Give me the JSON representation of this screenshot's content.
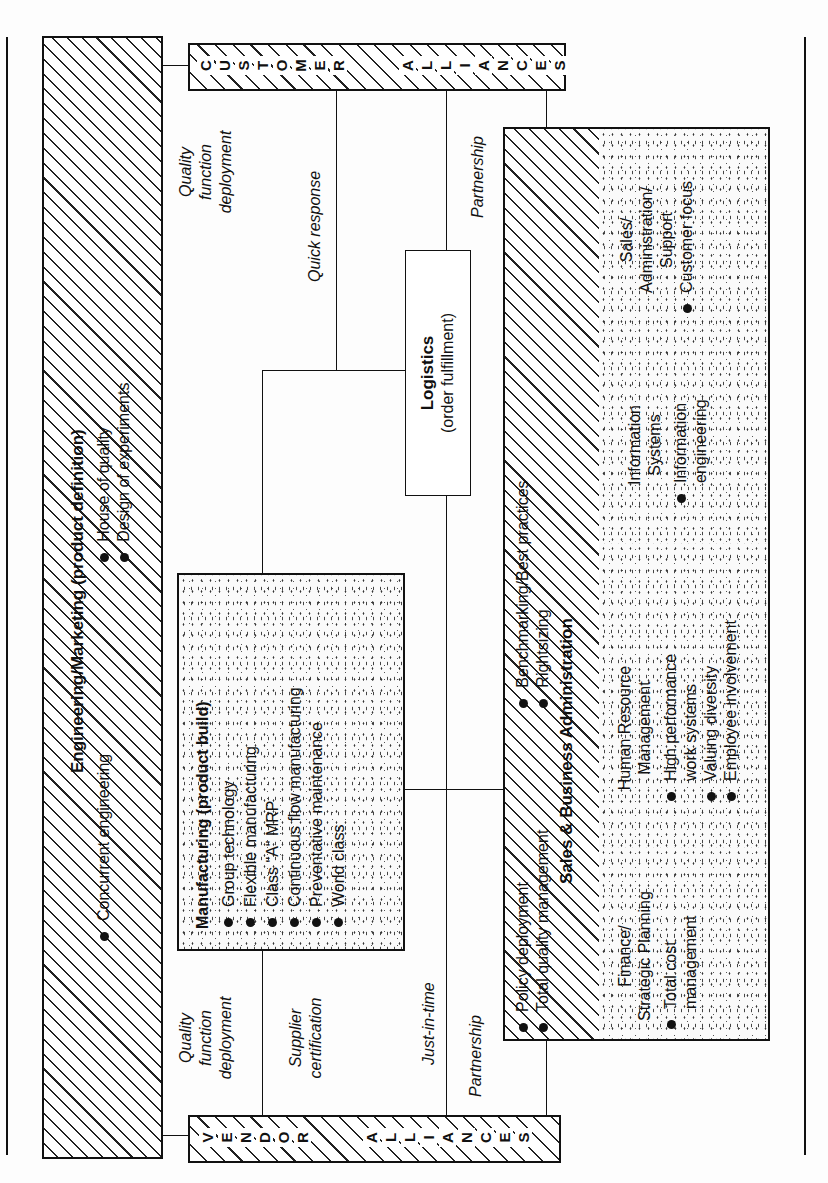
{
  "diagram": {
    "orientation": "rotated-90-counterclockwise",
    "engineering_marketing": {
      "title": "Engineering/Marketing  (product definition)",
      "items": [
        "Concurrent engineering",
        "House  of quality",
        "Design of experiments"
      ]
    },
    "customer_alliances": {
      "label": "CUSTOMER ALLIANCES",
      "letters": [
        "C",
        "U",
        "S",
        "T",
        "O",
        "M",
        "E",
        "R",
        " ",
        "A",
        "L",
        "L",
        "I",
        "A",
        "N",
        "C",
        "E",
        "S"
      ]
    },
    "vendor_alliances": {
      "label": "VENDOR ALLIANCES",
      "letters": [
        "V",
        "E",
        "N",
        "D",
        "O",
        "R",
        " ",
        "A",
        "L",
        "L",
        "I",
        "A",
        "N",
        "C",
        "E",
        "S"
      ]
    },
    "manufacturing": {
      "title": "Manufacturing (product  build)",
      "items": [
        "Group technology",
        "Flexible manufacturing",
        "Class \"A\" MRP",
        "Continuous flow manufacturing",
        "Preventative maintenance",
        "World class"
      ]
    },
    "logistics": {
      "title": "Logistics",
      "subtitle": "(order fulfillment)"
    },
    "sales_business_admin": {
      "title": "Sales & Business Administration",
      "items_left": [
        "Policy deployment",
        "Total quality management"
      ],
      "items_right": [
        "Benchmarking/Best practices",
        "Rightsizing"
      ],
      "departments": [
        {
          "title_lines": [
            "Finance/",
            "Strategic Planning"
          ],
          "items": [
            "Total cost management"
          ]
        },
        {
          "title_lines": [
            "Human Resource",
            "Management"
          ],
          "items": [
            "High  performance work systems",
            "Valuing diversity",
            "Employee involvement"
          ]
        },
        {
          "title_lines": [
            "Information",
            "Systems"
          ],
          "items": [
            "Information engineering"
          ]
        },
        {
          "title_lines": [
            "Sales/",
            "Administration/",
            "Support"
          ],
          "items": [
            "Customer focus"
          ]
        }
      ]
    },
    "connector_labels": {
      "customer_side": {
        "qfd": [
          "Quality",
          "function",
          "deployment"
        ],
        "quick_response": "Quick response",
        "partnership": "Partnership"
      },
      "vendor_side": {
        "qfd": [
          "Quality",
          "function",
          "deployment"
        ],
        "supplier_certification": [
          "Supplier",
          "certification"
        ],
        "just_in_time": "Just-in-time",
        "partnership": "Partnership"
      }
    }
  }
}
